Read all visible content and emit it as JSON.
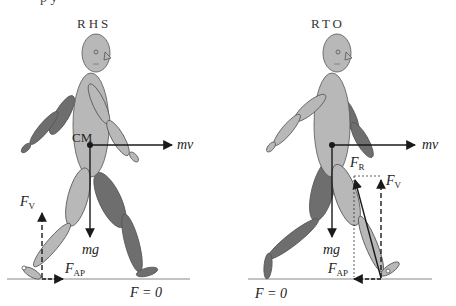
{
  "figure": {
    "top_cut_text": "p                          y",
    "panels": [
      {
        "title": "RHS",
        "labels": {
          "cm": "CM",
          "mv": "mv",
          "mg": "mg",
          "fv_main": "F",
          "fv_sub": "V",
          "fap_main": "F",
          "fap_sub": "AP",
          "f_zero": "F = 0"
        }
      },
      {
        "title": "RTO",
        "labels": {
          "mv": "mv",
          "mg": "mg",
          "fr_main": "F",
          "fr_sub": "R",
          "fv_main": "F",
          "fv_sub": "V",
          "fap_main": "F",
          "fap_sub": "AP",
          "f_zero": "F = 0"
        }
      }
    ],
    "colors": {
      "light_segment": "#b8b8b8",
      "dark_segment": "#6e6e6e",
      "outline": "#555555",
      "arrow": "#1a1a1a",
      "ground": "#888888"
    }
  }
}
